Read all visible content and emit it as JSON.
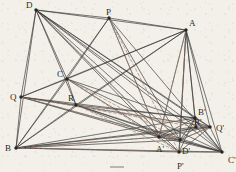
{
  "figure": {
    "width": 236,
    "height": 172,
    "background_color": "#f3f0e9",
    "ink_color": "#3a3a38",
    "dashed_color": "#9a7b6a",
    "vertex_color": "#262624",
    "bottom_mark": "",
    "points": [
      {
        "id": "D",
        "label": "D",
        "x": 36,
        "y": 10,
        "label_dx": -10,
        "label_dy": -9
      },
      {
        "id": "P",
        "label": "P",
        "x": 109,
        "y": 18,
        "label_dx": -3,
        "label_dy": -10
      },
      {
        "id": "A",
        "label": "A",
        "x": 186,
        "y": 30,
        "label_dx": 3,
        "label_dy": -11
      },
      {
        "id": "C",
        "label": "C",
        "x": 67,
        "y": 79,
        "label_dx": -10,
        "label_dy": -9
      },
      {
        "id": "Q",
        "label": "Q",
        "x": 21,
        "y": 97,
        "label_dx": -11,
        "label_dy": -4
      },
      {
        "id": "R",
        "label": "R",
        "x": 76,
        "y": 105,
        "label_dx": -8,
        "label_dy": -11
      },
      {
        "id": "B",
        "label": "B",
        "x": 16,
        "y": 148,
        "label_dx": -11,
        "label_dy": -4
      },
      {
        "id": "Bprime",
        "label": "B'",
        "x": 195,
        "y": 118,
        "label_dx": 3,
        "label_dy": -10
      },
      {
        "id": "Qprime",
        "label": "Q'",
        "x": 210,
        "y": 127,
        "label_dx": 6,
        "label_dy": -3
      },
      {
        "id": "Rprime",
        "label": "R'",
        "x": 196,
        "y": 127,
        "label_dx": -2,
        "label_dy": -9
      },
      {
        "id": "Aprime",
        "label": "A'",
        "x": 159,
        "y": 137,
        "label_dx": -3,
        "label_dy": 8
      },
      {
        "id": "Dprime",
        "label": "D'",
        "x": 180,
        "y": 140,
        "label_dx": 2,
        "label_dy": 7
      },
      {
        "id": "Pprime",
        "label": "P'",
        "x": 179,
        "y": 152,
        "label_dx": -2,
        "label_dy": 10
      },
      {
        "id": "Cprime",
        "label": "C'",
        "x": 222,
        "y": 152,
        "label_dx": 6,
        "label_dy": 4
      }
    ],
    "solid_edges": [
      [
        "D",
        "P"
      ],
      [
        "P",
        "A"
      ],
      [
        "D",
        "A"
      ],
      [
        "D",
        "B"
      ],
      [
        "B",
        "Cprime"
      ],
      [
        "A",
        "Cprime"
      ],
      [
        "D",
        "C"
      ],
      [
        "D",
        "R"
      ],
      [
        "D",
        "Q"
      ],
      [
        "D",
        "Aprime"
      ],
      [
        "D",
        "Dprime"
      ],
      [
        "D",
        "Bprime"
      ],
      [
        "D",
        "Qprime"
      ],
      [
        "D",
        "Cprime"
      ],
      [
        "D",
        "Pprime"
      ],
      [
        "D",
        "Rprime"
      ],
      [
        "P",
        "B"
      ],
      [
        "P",
        "C"
      ],
      [
        "P",
        "Aprime"
      ],
      [
        "P",
        "Dprime"
      ],
      [
        "P",
        "Cprime"
      ],
      [
        "A",
        "B"
      ],
      [
        "A",
        "C"
      ],
      [
        "A",
        "Q"
      ],
      [
        "A",
        "R"
      ],
      [
        "A",
        "Aprime"
      ],
      [
        "A",
        "Dprime"
      ],
      [
        "A",
        "Pprime"
      ],
      [
        "A",
        "Bprime"
      ],
      [
        "A",
        "Rprime"
      ],
      [
        "A",
        "Qprime"
      ],
      [
        "C",
        "B"
      ],
      [
        "C",
        "Q"
      ],
      [
        "C",
        "R"
      ],
      [
        "C",
        "Cprime"
      ],
      [
        "C",
        "Aprime"
      ],
      [
        "C",
        "Qprime"
      ],
      [
        "Q",
        "B"
      ],
      [
        "Q",
        "R"
      ],
      [
        "Q",
        "Cprime"
      ],
      [
        "Q",
        "Aprime"
      ],
      [
        "Q",
        "Bprime"
      ],
      [
        "Q",
        "Qprime"
      ],
      [
        "R",
        "B"
      ],
      [
        "R",
        "Cprime"
      ],
      [
        "R",
        "Aprime"
      ],
      [
        "R",
        "Dprime"
      ],
      [
        "R",
        "Bprime"
      ],
      [
        "B",
        "Aprime"
      ],
      [
        "B",
        "Dprime"
      ],
      [
        "B",
        "Bprime"
      ],
      [
        "B",
        "Rprime"
      ],
      [
        "B",
        "Qprime"
      ],
      [
        "B",
        "Pprime"
      ],
      [
        "Aprime",
        "Dprime"
      ],
      [
        "Aprime",
        "Bprime"
      ],
      [
        "Aprime",
        "Rprime"
      ],
      [
        "Aprime",
        "Qprime"
      ],
      [
        "Aprime",
        "Cprime"
      ],
      [
        "Aprime",
        "Pprime"
      ],
      [
        "Dprime",
        "Bprime"
      ],
      [
        "Dprime",
        "Rprime"
      ],
      [
        "Dprime",
        "Qprime"
      ],
      [
        "Dprime",
        "Cprime"
      ],
      [
        "Dprime",
        "Pprime"
      ],
      [
        "Bprime",
        "Rprime"
      ],
      [
        "Bprime",
        "Qprime"
      ],
      [
        "Bprime",
        "Cprime"
      ],
      [
        "Rprime",
        "Qprime"
      ],
      [
        "Rprime",
        "Cprime"
      ],
      [
        "Qprime",
        "Cprime"
      ],
      [
        "Pprime",
        "Cprime"
      ],
      [
        "Pprime",
        "Bprime"
      ],
      [
        "Pprime",
        "Qprime"
      ]
    ],
    "dashed_edges": [
      [
        "D",
        "Pprime"
      ],
      [
        "P",
        "Pprime"
      ],
      [
        "P",
        "Aprime"
      ],
      [
        "C",
        "Dprime"
      ],
      [
        "C",
        "Pprime"
      ],
      [
        "Q",
        "Dprime"
      ],
      [
        "Q",
        "Rprime"
      ],
      [
        "R",
        "Qprime"
      ],
      [
        "R",
        "Pprime"
      ],
      [
        "B",
        "Aprime"
      ],
      [
        "B",
        "Cprime"
      ],
      [
        "A",
        "Aprime"
      ],
      [
        "A",
        "Pprime"
      ],
      [
        "Aprime",
        "Qprime"
      ],
      [
        "Dprime",
        "Qprime"
      ]
    ]
  }
}
